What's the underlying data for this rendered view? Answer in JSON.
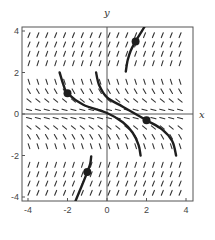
{
  "chart_data": {
    "type": "slope-field",
    "title": "",
    "xlabel": "x",
    "ylabel": "y",
    "xlim": [
      -4,
      4
    ],
    "ylim": [
      -4,
      4
    ],
    "xticks": [
      -4,
      -2,
      0,
      2,
      4
    ],
    "yticks": [
      -4,
      -2,
      0,
      2,
      4
    ],
    "xtick_labels": [
      "-4",
      "-2",
      "0",
      "2",
      "4"
    ],
    "ytick_labels": [
      "-4",
      "-2",
      "0",
      "2",
      "4"
    ],
    "grid": false,
    "slope_field": {
      "description": "slope depends on y only; steep positive for |y|>2, negative for 0<|y|<2, near-vertical at y=±2",
      "rows_y": [
        3.8,
        3.35,
        2.9,
        2.45,
        1.55,
        1.1,
        0.65,
        0.2,
        -0.2,
        -0.65,
        -1.1,
        -1.55,
        -2.45,
        -2.9,
        -3.35,
        -3.8
      ],
      "rows_slope_deg": [
        68,
        68,
        70,
        72,
        -72,
        -60,
        -40,
        -15,
        -15,
        -40,
        -60,
        -72,
        72,
        70,
        68,
        68
      ],
      "cols_x": [
        -3.95,
        -3.5,
        -3.05,
        -2.6,
        -2.15,
        -1.7,
        -1.25,
        -0.8,
        -0.35,
        0.1,
        0.55,
        1.0,
        1.45,
        1.9,
        2.35,
        2.8,
        3.25,
        3.7
      ]
    },
    "series": [
      {
        "name": "solution-curve-1",
        "points": [
          [
            -2.4,
            2.0
          ],
          [
            -2.2,
            1.4
          ],
          [
            -2.0,
            1.0
          ],
          [
            -1.2,
            0.45
          ],
          [
            0.0,
            0.05
          ],
          [
            0.8,
            -0.4
          ],
          [
            1.3,
            -0.9
          ],
          [
            1.6,
            -1.5
          ],
          [
            1.7,
            -2.0
          ]
        ],
        "marker": [
          -2.0,
          1.0
        ]
      },
      {
        "name": "solution-curve-2",
        "points": [
          [
            -0.55,
            2.0
          ],
          [
            -0.4,
            1.4
          ],
          [
            0.0,
            0.8
          ],
          [
            0.8,
            0.35
          ],
          [
            2.0,
            -0.3
          ],
          [
            2.8,
            -0.75
          ],
          [
            3.3,
            -1.3
          ],
          [
            3.5,
            -2.0
          ]
        ],
        "marker": [
          2.0,
          -0.3
        ]
      },
      {
        "name": "solution-curve-3",
        "points": [
          [
            0.95,
            2.05
          ],
          [
            1.05,
            2.6
          ],
          [
            1.2,
            3.05
          ],
          [
            1.45,
            3.5
          ],
          [
            1.7,
            3.9
          ],
          [
            1.9,
            4.2
          ]
        ],
        "marker": [
          1.45,
          3.5
        ]
      },
      {
        "name": "solution-curve-4",
        "points": [
          [
            -0.8,
            -2.05
          ],
          [
            -0.85,
            -2.4
          ],
          [
            -1.0,
            -2.8
          ],
          [
            -1.25,
            -3.4
          ],
          [
            -1.6,
            -4.2
          ]
        ],
        "marker": [
          -1.0,
          -2.8
        ]
      }
    ]
  },
  "colors": {
    "frame": "#555555",
    "field": "#333333",
    "curve": "#1e1e1e",
    "text": "#444444"
  }
}
